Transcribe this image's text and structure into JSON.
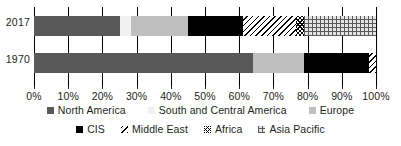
{
  "chart_data": {
    "type": "bar",
    "orientation": "horizontal",
    "stacked": true,
    "normalized": true,
    "title": "",
    "subtitle": "",
    "xlabel": "",
    "ylabel": "",
    "xlim": [
      0,
      100
    ],
    "xunit": "%",
    "grid": true,
    "legend_position": "bottom",
    "categories": [
      "2017",
      "1970"
    ],
    "tick_labels": [
      "0%",
      "10%",
      "20%",
      "30%",
      "40%",
      "50%",
      "60%",
      "70%",
      "80%",
      "90%",
      "100%"
    ],
    "tick_values": [
      0,
      10,
      20,
      30,
      40,
      50,
      60,
      70,
      80,
      90,
      100
    ],
    "series": [
      {
        "name": "North America",
        "key": "north-america",
        "color": "#595959",
        "pattern": "solid",
        "values": [
          25.0,
          64.0
        ]
      },
      {
        "name": "South and Central America",
        "key": "south-central-america",
        "color": "#f1f1f1",
        "pattern": "solid",
        "values": [
          3.5,
          0.0
        ]
      },
      {
        "name": "Europe",
        "key": "europe",
        "color": "#bfbfbf",
        "pattern": "solid",
        "values": [
          16.5,
          15.0
        ]
      },
      {
        "name": "CIS",
        "key": "cis",
        "color": "#000000",
        "pattern": "solid",
        "values": [
          16.0,
          19.0
        ]
      },
      {
        "name": "Middle East",
        "key": "middle-east",
        "color": "#ffffff",
        "pattern": "diagonal-hatch",
        "values": [
          15.5,
          2.0
        ]
      },
      {
        "name": "Africa",
        "key": "africa",
        "color": "#ffffff",
        "pattern": "cross-dot",
        "values": [
          2.5,
          0.0
        ]
      },
      {
        "name": "Asia Pacific",
        "key": "asia-pacific",
        "color": "#e4e4e4",
        "pattern": "grid",
        "values": [
          21.0,
          0.0
        ]
      }
    ]
  },
  "axis": {
    "y_categories": [
      {
        "label": "2017"
      },
      {
        "label": "1970"
      }
    ],
    "x_ticks": [
      {
        "label": "0%",
        "value": 0
      },
      {
        "label": "10%",
        "value": 10
      },
      {
        "label": "20%",
        "value": 20
      },
      {
        "label": "30%",
        "value": 30
      },
      {
        "label": "40%",
        "value": 40
      },
      {
        "label": "50%",
        "value": 50
      },
      {
        "label": "60%",
        "value": 60
      },
      {
        "label": "70%",
        "value": 70
      },
      {
        "label": "80%",
        "value": 80
      },
      {
        "label": "90%",
        "value": 90
      },
      {
        "label": "100%",
        "value": 100
      }
    ]
  },
  "legend": {
    "row1": [
      {
        "label": "North America",
        "key": "north-america"
      },
      {
        "label": "South and Central America",
        "key": "south-central-america"
      },
      {
        "label": "Europe",
        "key": "europe"
      }
    ],
    "row2": [
      {
        "label": "CIS",
        "key": "cis"
      },
      {
        "label": "Middle East",
        "key": "middle-east"
      },
      {
        "label": "Africa",
        "key": "africa"
      },
      {
        "label": "Asia Pacific",
        "key": "asia-pacific"
      }
    ]
  }
}
